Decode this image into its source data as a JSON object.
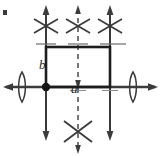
{
  "figure": {
    "kind": "plane-group-symmetry-diagram",
    "background_color": "#ffffff",
    "stroke_color": "#2b2b2b",
    "cell_stroke_color": "#1d1d1d",
    "dash_color": "#5a5a5a",
    "labels": {
      "vector_a": "a",
      "vector_b": "b"
    },
    "unit_cell": {
      "x": 46,
      "y": 47,
      "width": 64,
      "height": 40,
      "origin_dot": {
        "x": 46,
        "y": 87,
        "r": 4
      }
    },
    "axes": {
      "horizontal_line": {
        "x1": 4,
        "y1": 87,
        "x2": 157,
        "y2": 87
      },
      "vertical_lines": [
        {
          "x": 46,
          "y1": 6,
          "y2": 140,
          "style": "solid"
        },
        {
          "x": 78,
          "y1": 6,
          "y2": 152,
          "style": "dashed"
        },
        {
          "x": 110,
          "y1": 6,
          "y2": 140,
          "style": "solid"
        }
      ]
    },
    "arrow_markers": [
      {
        "name": "up-arrow-left",
        "x": 46,
        "y": 6,
        "direction": "up"
      },
      {
        "name": "up-arrow-center",
        "x": 78,
        "y": 6,
        "direction": "up"
      },
      {
        "name": "up-arrow-right",
        "x": 110,
        "y": 6,
        "direction": "up"
      },
      {
        "name": "down-arrow-left",
        "x": 46,
        "y": 140,
        "direction": "down"
      },
      {
        "name": "down-arrow-center",
        "x": 78,
        "y": 152,
        "direction": "down"
      },
      {
        "name": "down-arrow-right",
        "x": 110,
        "y": 140,
        "direction": "down"
      },
      {
        "name": "left-arrow",
        "x": 4,
        "y": 87,
        "direction": "left"
      },
      {
        "name": "right-arrow",
        "x": 157,
        "y": 87,
        "direction": "right"
      },
      {
        "name": "down-arrow-cell-center",
        "x": 78,
        "y": 87,
        "direction": "down"
      }
    ],
    "rotation_axis_markers": [
      {
        "name": "two-fold-axis-top-left",
        "cx": 46,
        "cy": 26
      },
      {
        "name": "two-fold-axis-top-center",
        "cx": 78,
        "cy": 26
      },
      {
        "name": "two-fold-axis-top-right",
        "cx": 110,
        "cy": 26
      },
      {
        "name": "two-fold-axis-bottom-center",
        "cx": 78,
        "cy": 131
      }
    ],
    "lens_markers": [
      {
        "name": "lens-marker-left",
        "cx": 22,
        "cy": 87
      },
      {
        "name": "lens-marker-right",
        "cx": 133,
        "cy": 87
      }
    ],
    "tick_marks": [
      {
        "name": "tick-top-left",
        "x": 46,
        "y": 44
      },
      {
        "name": "tick-top-center",
        "x": 78,
        "y": 44
      },
      {
        "name": "tick-top-right",
        "x": 110,
        "y": 44
      },
      {
        "name": "tick-bottom-center",
        "x": 78,
        "y": 90
      },
      {
        "name": "tick-bottom-right",
        "x": 110,
        "y": 90
      }
    ],
    "corner_artifact": {
      "x": 3,
      "y": 10,
      "w": 4,
      "h": 5
    }
  }
}
